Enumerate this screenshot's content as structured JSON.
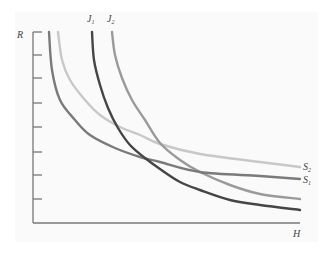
{
  "chart_data": {
    "type": "line",
    "title": "",
    "xlabel": "H",
    "ylabel": "R",
    "grid": false,
    "y_ticks": 8,
    "series": [
      {
        "name": "S1",
        "label": "S",
        "subscript": "1",
        "color": "#7a7a7a",
        "points": [
          [
            49,
            32
          ],
          [
            52,
            70
          ],
          [
            60,
            100
          ],
          [
            75,
            120
          ],
          [
            90,
            135
          ],
          [
            115,
            148
          ],
          [
            140,
            157
          ],
          [
            160,
            162
          ],
          [
            200,
            172
          ],
          [
            260,
            176
          ],
          [
            300,
            179
          ]
        ]
      },
      {
        "name": "S2",
        "label": "S",
        "subscript": "2",
        "color": "#c8c8c8",
        "points": [
          [
            58,
            32
          ],
          [
            62,
            60
          ],
          [
            70,
            80
          ],
          [
            85,
            100
          ],
          [
            100,
            115
          ],
          [
            120,
            127
          ],
          [
            140,
            135
          ],
          [
            160,
            144
          ],
          [
            200,
            154
          ],
          [
            260,
            162
          ],
          [
            300,
            167
          ]
        ]
      },
      {
        "name": "J1",
        "label": "J",
        "subscript": "1",
        "color": "#454545",
        "points": [
          [
            92,
            32
          ],
          [
            94,
            60
          ],
          [
            100,
            85
          ],
          [
            108,
            108
          ],
          [
            118,
            128
          ],
          [
            130,
            145
          ],
          [
            145,
            158
          ],
          [
            160,
            169
          ],
          [
            180,
            182
          ],
          [
            200,
            190
          ],
          [
            230,
            200
          ],
          [
            260,
            205
          ],
          [
            300,
            210
          ]
        ]
      },
      {
        "name": "J2",
        "label": "J",
        "subscript": "2",
        "color": "#9a9a9a",
        "points": [
          [
            112,
            32
          ],
          [
            115,
            55
          ],
          [
            122,
            78
          ],
          [
            132,
            100
          ],
          [
            145,
            120
          ],
          [
            160,
            143
          ],
          [
            180,
            160
          ],
          [
            200,
            172
          ],
          [
            230,
            185
          ],
          [
            260,
            194
          ],
          [
            300,
            199
          ]
        ]
      }
    ]
  },
  "labels": {
    "y_axis": "R",
    "x_axis": "H",
    "j1": "J",
    "j1_sub": "1",
    "j2": "J",
    "j2_sub": "2",
    "s1": "S",
    "s1_sub": "1",
    "s2": "S",
    "s2_sub": "2"
  }
}
